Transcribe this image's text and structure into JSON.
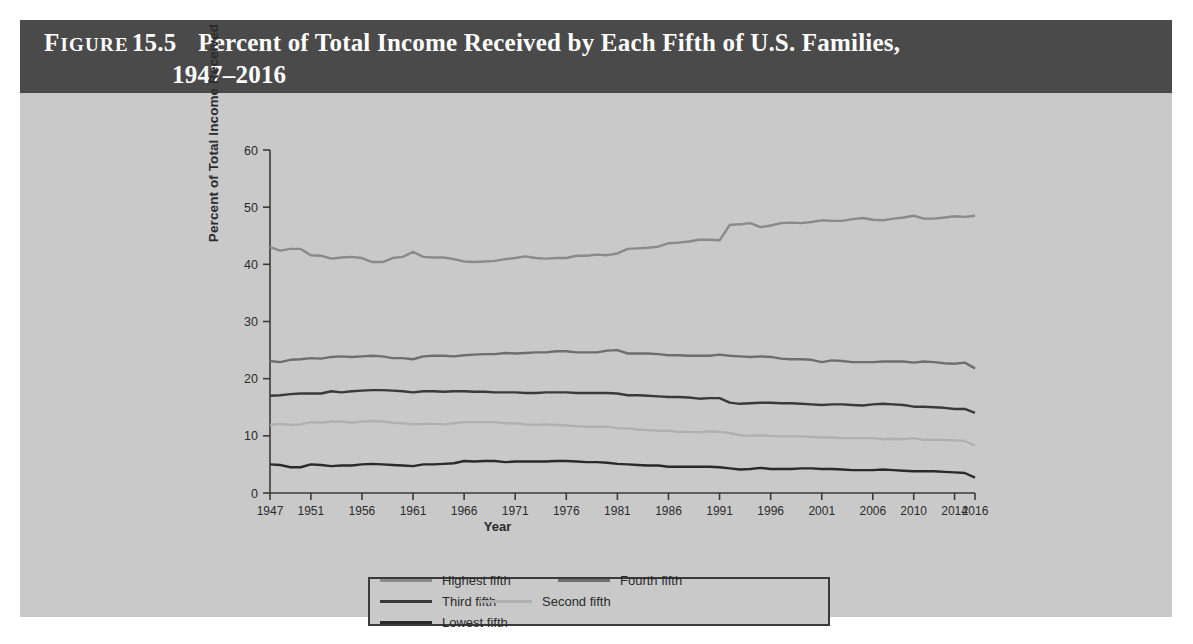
{
  "figure": {
    "label_word": "Figure",
    "number": "15.5",
    "title_line1": "Percent of Total Income Received by Each Fifth of U.S. Families,",
    "title_line2": "1947–2016",
    "header_bg": "#4a4a4a",
    "body_bg": "#c9c9c9"
  },
  "chart_data": {
    "type": "line",
    "xlabel": "Year",
    "ylabel": "Percent of Total Income Received",
    "ylim": [
      0,
      60
    ],
    "yticks": [
      0,
      10,
      20,
      30,
      40,
      50,
      60
    ],
    "xlim": [
      1947,
      2016
    ],
    "xticks": [
      1947,
      1951,
      1956,
      1961,
      1966,
      1971,
      1976,
      1981,
      1986,
      1991,
      1996,
      2001,
      2006,
      2010,
      2014,
      2016
    ],
    "grid": false,
    "legend_position": "bottom",
    "x": [
      1947,
      1948,
      1949,
      1950,
      1951,
      1952,
      1953,
      1954,
      1955,
      1956,
      1957,
      1958,
      1959,
      1960,
      1961,
      1962,
      1963,
      1964,
      1965,
      1966,
      1967,
      1968,
      1969,
      1970,
      1971,
      1972,
      1973,
      1974,
      1975,
      1976,
      1977,
      1978,
      1979,
      1980,
      1981,
      1982,
      1983,
      1984,
      1985,
      1986,
      1987,
      1988,
      1989,
      1990,
      1991,
      1992,
      1993,
      1994,
      1995,
      1996,
      1997,
      1998,
      1999,
      2000,
      2001,
      2002,
      2003,
      2004,
      2005,
      2006,
      2007,
      2008,
      2009,
      2010,
      2011,
      2012,
      2013,
      2014,
      2015,
      2016
    ],
    "series": [
      {
        "name": "Highest fifth",
        "color": "#8a8a8a",
        "values": [
          43.0,
          42.4,
          42.7,
          42.7,
          41.6,
          41.5,
          41.0,
          41.2,
          41.3,
          41.1,
          40.4,
          40.4,
          41.1,
          41.3,
          42.2,
          41.3,
          41.2,
          41.2,
          40.9,
          40.5,
          40.4,
          40.5,
          40.6,
          40.9,
          41.1,
          41.4,
          41.1,
          41.0,
          41.1,
          41.1,
          41.5,
          41.5,
          41.7,
          41.6,
          41.9,
          42.7,
          42.8,
          42.9,
          43.1,
          43.7,
          43.8,
          44.0,
          44.3,
          44.3,
          44.2,
          46.9,
          47.0,
          47.2,
          46.5,
          46.8,
          47.2,
          47.3,
          47.2,
          47.4,
          47.7,
          47.6,
          47.6,
          47.9,
          48.1,
          47.8,
          47.7,
          48.0,
          48.2,
          48.5,
          48.0,
          48.0,
          48.2,
          48.4,
          48.3,
          48.5
        ]
      },
      {
        "name": "Fourth fifth",
        "color": "#6e6e6e",
        "values": [
          23.1,
          22.9,
          23.3,
          23.4,
          23.6,
          23.5,
          23.8,
          23.9,
          23.8,
          23.9,
          24.0,
          23.9,
          23.6,
          23.6,
          23.4,
          23.9,
          24.0,
          24.0,
          23.9,
          24.1,
          24.2,
          24.3,
          24.3,
          24.5,
          24.4,
          24.5,
          24.6,
          24.6,
          24.8,
          24.8,
          24.6,
          24.6,
          24.6,
          24.9,
          25.0,
          24.4,
          24.4,
          24.4,
          24.3,
          24.1,
          24.1,
          24.0,
          24.0,
          24.0,
          24.2,
          24.0,
          23.9,
          23.8,
          23.9,
          23.8,
          23.5,
          23.4,
          23.4,
          23.3,
          22.9,
          23.2,
          23.1,
          22.9,
          22.9,
          22.9,
          23.0,
          23.0,
          23.0,
          22.8,
          23.0,
          22.9,
          22.7,
          22.6,
          22.8,
          21.8
        ]
      },
      {
        "name": "Third fifth",
        "color": "#3a3a3a",
        "values": [
          17.0,
          17.1,
          17.3,
          17.4,
          17.4,
          17.4,
          17.8,
          17.6,
          17.8,
          17.9,
          18.0,
          18.0,
          17.9,
          17.8,
          17.6,
          17.8,
          17.8,
          17.7,
          17.8,
          17.8,
          17.7,
          17.7,
          17.6,
          17.6,
          17.6,
          17.5,
          17.5,
          17.6,
          17.6,
          17.6,
          17.5,
          17.5,
          17.5,
          17.5,
          17.4,
          17.1,
          17.1,
          17.0,
          16.9,
          16.8,
          16.8,
          16.7,
          16.5,
          16.6,
          16.6,
          15.8,
          15.6,
          15.7,
          15.8,
          15.8,
          15.7,
          15.7,
          15.6,
          15.5,
          15.4,
          15.5,
          15.5,
          15.4,
          15.3,
          15.5,
          15.6,
          15.5,
          15.4,
          15.1,
          15.1,
          15.0,
          14.9,
          14.7,
          14.7,
          14.0
        ]
      },
      {
        "name": "Second fifth",
        "color": "#b0b0b0",
        "values": [
          11.9,
          12.1,
          11.9,
          12.0,
          12.4,
          12.3,
          12.5,
          12.5,
          12.3,
          12.5,
          12.6,
          12.5,
          12.3,
          12.2,
          12.0,
          12.1,
          12.1,
          12.0,
          12.2,
          12.4,
          12.4,
          12.4,
          12.4,
          12.2,
          12.2,
          12.0,
          11.9,
          12.0,
          11.9,
          11.8,
          11.7,
          11.6,
          11.6,
          11.6,
          11.3,
          11.3,
          11.1,
          11.0,
          10.9,
          10.9,
          10.7,
          10.7,
          10.6,
          10.8,
          10.7,
          10.5,
          10.1,
          10.0,
          10.1,
          10.0,
          9.9,
          9.9,
          9.9,
          9.8,
          9.7,
          9.7,
          9.6,
          9.6,
          9.6,
          9.6,
          9.4,
          9.5,
          9.4,
          9.6,
          9.3,
          9.3,
          9.3,
          9.2,
          9.1,
          8.3
        ]
      },
      {
        "name": "Lowest fifth",
        "color": "#2a2a2a",
        "values": [
          5.0,
          4.9,
          4.5,
          4.5,
          5.0,
          4.9,
          4.7,
          4.8,
          4.8,
          5.0,
          5.1,
          5.0,
          4.9,
          4.8,
          4.7,
          5.0,
          5.0,
          5.1,
          5.2,
          5.6,
          5.5,
          5.6,
          5.6,
          5.4,
          5.5,
          5.5,
          5.5,
          5.5,
          5.6,
          5.6,
          5.5,
          5.4,
          5.4,
          5.3,
          5.1,
          5.0,
          4.9,
          4.8,
          4.8,
          4.6,
          4.6,
          4.6,
          4.6,
          4.6,
          4.5,
          4.3,
          4.1,
          4.2,
          4.4,
          4.2,
          4.2,
          4.2,
          4.3,
          4.3,
          4.2,
          4.2,
          4.1,
          4.0,
          4.0,
          4.0,
          4.1,
          4.0,
          3.9,
          3.8,
          3.8,
          3.8,
          3.7,
          3.6,
          3.5,
          2.7
        ]
      }
    ]
  },
  "legend": {
    "items": [
      {
        "label": "Highest fifth",
        "color": "#8a8a8a"
      },
      {
        "label": "Fourth fifth",
        "color": "#6e6e6e"
      },
      {
        "label": "Third fifth",
        "color": "#3a3a3a"
      },
      {
        "label": "Second fifth",
        "color": "#b0b0b0"
      },
      {
        "label": "Lowest fifth",
        "color": "#2a2a2a"
      }
    ]
  }
}
